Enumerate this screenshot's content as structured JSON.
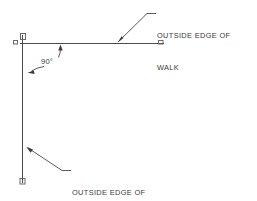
{
  "drawing": {
    "type": "engineering-plan-detail",
    "background_color": "#ffffff",
    "line_color": "#4a4a4a",
    "text_color": "#3a3a3a",
    "labels": {
      "top_callout_line1": "OUTSIDE EDGE OF",
      "top_callout_line2": "WALK",
      "bottom_callout_line1": "OUTSIDE EDGE OF",
      "bottom_callout_line2": "WALK",
      "angle_annotation": "90°"
    },
    "geometry": {
      "horizontal_walk_edge": {
        "x1": 20,
        "y1": 43,
        "x2": 164,
        "y2": 43
      },
      "vertical_walk_edge": {
        "x1": 22,
        "y1": 35,
        "x2": 22,
        "y2": 183
      },
      "corner_marker_top": {
        "x": 21,
        "y": 34,
        "size": 5
      },
      "corner_marker_left": {
        "x": 13,
        "y": 40,
        "size": 4
      },
      "end_marker_right": {
        "x": 160,
        "y": 40,
        "size": 4
      },
      "end_marker_bottom": {
        "x": 20,
        "y": 179,
        "size": 5
      }
    },
    "leaders": [
      {
        "name": "top-callout-leader",
        "from": "text",
        "to": "horizontal_walk_edge",
        "arrow": "down-left"
      },
      {
        "name": "bottom-callout-leader",
        "from": "text",
        "to": "vertical_walk_edge",
        "arrow": "up-left"
      },
      {
        "name": "angle-leader-up",
        "from": "angle-label",
        "to": "horizontal_walk_edge",
        "arrow": "up"
      },
      {
        "name": "angle-leader-left",
        "from": "angle-label",
        "to": "vertical_walk_edge",
        "arrow": "left"
      }
    ]
  }
}
